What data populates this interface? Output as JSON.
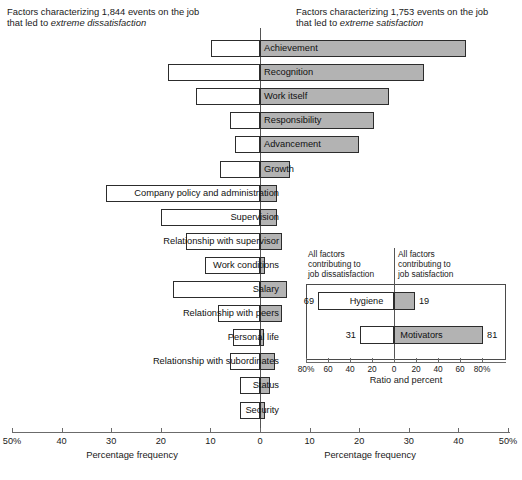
{
  "captions": {
    "left_line1": "Factors characterizing 1,844 events on the job",
    "left_line2_prefix": "that led to ",
    "left_line2_em": "extreme dissatisfaction",
    "right_line1": "Factors characterizing 1,753 events on the job",
    "right_line2_prefix": "that led to ",
    "right_line2_em": "extreme satisfaction"
  },
  "axis": {
    "title_left": "Percentage frequency",
    "title_right": "Percentage frequency",
    "ticks": [
      "50%",
      "40",
      "30",
      "20",
      "10",
      "0",
      "10",
      "20",
      "30",
      "40",
      "50%"
    ],
    "min": -50,
    "max": 50
  },
  "inset": {
    "caption_left": "All factors\ncontributing to\njob dissatisfaction",
    "caption_right": "All factors\ncontributing to\njob satisfaction",
    "axis_title": "Ratio and percent",
    "ticks": [
      "80%",
      "60",
      "40",
      "20",
      "0",
      "20",
      "40",
      "60",
      "80%"
    ]
  },
  "colors": {
    "bar_fill_satisfaction": "#b3b3b3",
    "bar_fill_dissatisfaction": "#ffffff",
    "bar_border": "#2c2c2c",
    "axis": "#6b6b6b",
    "text": "#1a1a1a"
  },
  "chart_data": {
    "type": "bar",
    "orientation": "horizontal",
    "layout": "diverging",
    "xlabel": "Percentage frequency",
    "ylabel": "",
    "xlim": [
      -50,
      50
    ],
    "grid": false,
    "legend": "none",
    "series": [
      {
        "name": "Percentage frequency of extreme dissatisfaction",
        "side": "left"
      },
      {
        "name": "Percentage frequency of extreme satisfaction",
        "side": "right"
      }
    ],
    "categories": [
      "Achievement",
      "Recognition",
      "Work itself",
      "Responsibility",
      "Advancement",
      "Growth",
      "Company policy and administration",
      "Supervision",
      "Relationship with supervisor",
      "Work conditions",
      "Salary",
      "Relationship with peers",
      "Personal life",
      "Relationship with subordinates",
      "Status",
      "Security"
    ],
    "bars": [
      {
        "label": "Achievement",
        "dissatisfaction": 9.8,
        "satisfaction": 41.5,
        "label_side": "right"
      },
      {
        "label": "Recognition",
        "dissatisfaction": 18.5,
        "satisfaction": 33.0,
        "label_side": "right"
      },
      {
        "label": "Work itself",
        "dissatisfaction": 13.0,
        "satisfaction": 26.0,
        "label_side": "right"
      },
      {
        "label": "Responsibility",
        "dissatisfaction": 6.0,
        "satisfaction": 23.0,
        "label_side": "right"
      },
      {
        "label": "Advancement",
        "dissatisfaction": 5.0,
        "satisfaction": 20.0,
        "label_side": "right"
      },
      {
        "label": "Growth",
        "dissatisfaction": 8.0,
        "satisfaction": 6.0,
        "label_side": "right"
      },
      {
        "label": "Company policy and administration",
        "dissatisfaction": 31.0,
        "satisfaction": 3.5,
        "label_side": "left"
      },
      {
        "label": "Supervision",
        "dissatisfaction": 20.0,
        "satisfaction": 3.5,
        "label_side": "left"
      },
      {
        "label": "Relationship with supervisor",
        "dissatisfaction": 15.0,
        "satisfaction": 4.5,
        "label_side": "left"
      },
      {
        "label": "Work conditions",
        "dissatisfaction": 11.0,
        "satisfaction": 1.0,
        "label_side": "left"
      },
      {
        "label": "Salary",
        "dissatisfaction": 17.5,
        "satisfaction": 5.5,
        "label_side": "left"
      },
      {
        "label": "Relationship with peers",
        "dissatisfaction": 8.5,
        "satisfaction": 4.5,
        "label_side": "left"
      },
      {
        "label": "Personal life",
        "dissatisfaction": 5.5,
        "satisfaction": 0.8,
        "label_side": "left"
      },
      {
        "label": "Relationship with subordinates",
        "dissatisfaction": 6.0,
        "satisfaction": 3.0,
        "label_side": "left"
      },
      {
        "label": "Status",
        "dissatisfaction": 4.0,
        "satisfaction": 2.0,
        "label_side": "left"
      },
      {
        "label": "Security",
        "dissatisfaction": 4.0,
        "satisfaction": 1.0,
        "label_side": "left"
      }
    ],
    "inset_chart": {
      "type": "bar",
      "layout": "diverging",
      "xlabel": "Ratio and percent",
      "xlim": [
        -80,
        80
      ],
      "ticks": [
        "80%",
        "60",
        "40",
        "20",
        "0",
        "20",
        "40",
        "60",
        "80%"
      ],
      "caption_left": "All factors contributing to job dissatisfaction",
      "caption_right": "All factors contributing to job satisfaction",
      "bars": [
        {
          "label": "Hygiene",
          "dissatisfaction": 69,
          "satisfaction": 19,
          "label_side": "right"
        },
        {
          "label": "Motivators",
          "dissatisfaction": 31,
          "satisfaction": 81,
          "label_side": "right"
        }
      ]
    }
  }
}
